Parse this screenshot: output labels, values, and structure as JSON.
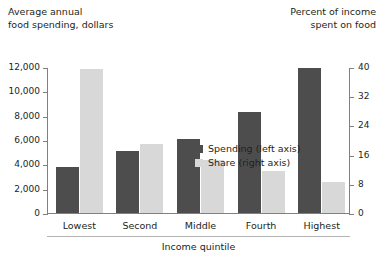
{
  "headers": {
    "left": "Average annual\nfood spending, dollars",
    "right": "Percent of income\nspent on food"
  },
  "legend": {
    "items": [
      {
        "label": "Spending (left axis)",
        "color": "#4d4d4d",
        "swatch_name": "legend-swatch-spending"
      },
      {
        "label": "Share (right axis)",
        "color": "#d8d8d8",
        "swatch_name": "legend-swatch-share"
      }
    ]
  },
  "axes": {
    "left_ticks": [
      "12,000",
      "10,000",
      "8,000",
      "6,000",
      "4,000",
      "2,000",
      "0"
    ],
    "right_ticks": [
      "40",
      "32",
      "24",
      "16",
      "8",
      "0"
    ],
    "x_title": "Income quintile"
  },
  "chart_data": {
    "type": "bar",
    "title": "",
    "subtitle": "",
    "categories": [
      "Lowest",
      "Second",
      "Middle",
      "Fourth",
      "Highest"
    ],
    "series": [
      {
        "name": "Spending (left axis)",
        "axis": "left",
        "unit": "dollars",
        "color": "#4d4d4d",
        "values": [
          3800,
          5100,
          6100,
          8300,
          11900
        ]
      },
      {
        "name": "Share (right axis)",
        "axis": "right",
        "unit": "percent",
        "color": "#d8d8d8",
        "values": [
          39.5,
          19.0,
          14.5,
          11.5,
          8.5
        ]
      }
    ],
    "xlabel": "Income quintile",
    "ylabel": "Average annual food spending, dollars",
    "y2label": "Percent of income spent on food",
    "ylim": [
      0,
      12000
    ],
    "y2lim": [
      0,
      40
    ],
    "ytick_step": 2000,
    "y2tick_step": 8,
    "grid": false,
    "legend_position": "inside-top-center"
  }
}
